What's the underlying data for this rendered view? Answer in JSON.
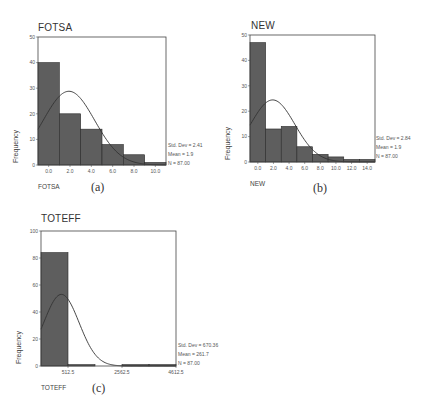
{
  "chart_data": [
    {
      "id": "a",
      "type": "bar",
      "title": "FOTSA",
      "subtitle_label": "(a)",
      "xlabel": "FOTSA",
      "ylabel": "Frequency",
      "bin_edges": [
        -1,
        1,
        3,
        5,
        7,
        9,
        11
      ],
      "categories": [
        "0.0",
        "2.0",
        "4.0",
        "6.0",
        "8.0",
        "10.0"
      ],
      "values": [
        40,
        20,
        14,
        8,
        4,
        1
      ],
      "xlim": [
        -1,
        11
      ],
      "ylim": [
        0,
        50
      ],
      "yticks": [
        0,
        10,
        20,
        30,
        40,
        50
      ],
      "xticks": [
        0,
        2,
        4,
        6,
        8,
        10
      ],
      "normal_curve": {
        "mean": 1.9,
        "std": 2.41,
        "n": 87,
        "bin_width": 2
      },
      "stats": {
        "std_dev": "Std. Dev = 2.41",
        "mean": "Mean = 1.9",
        "n": "N = 87.00"
      },
      "grid": false,
      "legend": "none"
    },
    {
      "id": "b",
      "type": "bar",
      "title": "NEW",
      "subtitle_label": "(b)",
      "xlabel": "NEW",
      "ylabel": "Frequency",
      "bin_edges": [
        -1,
        1,
        3,
        5,
        7,
        9,
        11,
        13,
        15
      ],
      "categories": [
        "0.0",
        "2.0",
        "4.0",
        "6.0",
        "8.0",
        "10.0",
        "12.0",
        "14.0"
      ],
      "values": [
        47,
        13,
        14,
        6,
        3,
        2,
        1,
        1
      ],
      "xlim": [
        -1,
        15
      ],
      "ylim": [
        0,
        50
      ],
      "yticks": [
        0,
        10,
        20,
        30,
        40,
        50
      ],
      "xticks": [
        0,
        2,
        4,
        6,
        8,
        10,
        12,
        14
      ],
      "normal_curve": {
        "mean": 1.9,
        "std": 2.84,
        "n": 87,
        "bin_width": 2
      },
      "stats": {
        "std_dev": "Std. Dev = 2.84",
        "mean": "Mean = 1.9",
        "n": "N = 87.00"
      },
      "grid": false,
      "legend": "none"
    },
    {
      "id": "c",
      "type": "bar",
      "title": "TOTEFF",
      "subtitle_label": "(c)",
      "xlabel": "TOTEFF",
      "ylabel": "Frequency",
      "bin_edges": [
        -512.5,
        512.5,
        1537.5,
        2562.5,
        3587.5,
        4612.5
      ],
      "categories": [
        "0.0",
        "1025.0",
        "2050.0",
        "3075.0",
        "4100.0"
      ],
      "values": [
        84,
        1,
        0,
        1,
        1
      ],
      "xlim": [
        -512.5,
        4612.5
      ],
      "ylim": [
        0,
        100
      ],
      "yticks": [
        0,
        20,
        40,
        60,
        80,
        100
      ],
      "xtick_labels": [
        "512.5",
        "2562.5",
        "4612.5"
      ],
      "xtick_positions": [
        512.5,
        2562.5,
        4612.5
      ],
      "normal_curve": {
        "mean": 261.7,
        "std": 670.36,
        "n": 87,
        "bin_width": 1025
      },
      "stats": {
        "std_dev": "Std. Dev = 670.36",
        "mean": "Mean = 261.7",
        "n": "N = 87.00"
      },
      "grid": false,
      "legend": "none"
    }
  ],
  "panels": {
    "a": {
      "title": "FOTSA",
      "ylabel": "Frequency",
      "xvar": "FOTSA",
      "sublabel": "(a)",
      "stats": {
        "std_dev": "Std. Dev = 2.41",
        "mean": "Mean = 1.9",
        "n": "N = 87.00"
      }
    },
    "b": {
      "title": "NEW",
      "ylabel": "Frequency",
      "xvar": "NEW",
      "sublabel": "(b)",
      "stats": {
        "std_dev": "Std. Dev = 2.84",
        "mean": "Mean = 1.9",
        "n": "N = 87.00"
      }
    },
    "c": {
      "title": "TOTEFF",
      "ylabel": "Frequency",
      "xvar": "TOTEFF",
      "sublabel": "(c)",
      "stats": {
        "std_dev": "Std. Dev = 670.36",
        "mean": "Mean = 261.7",
        "n": "N = 87.00"
      }
    }
  },
  "colors": {
    "bar_fill": "#5e5e5e",
    "bar_stroke": "#2a2a2a",
    "frame": "#444444",
    "curve": "#333333",
    "text": "#333333"
  }
}
